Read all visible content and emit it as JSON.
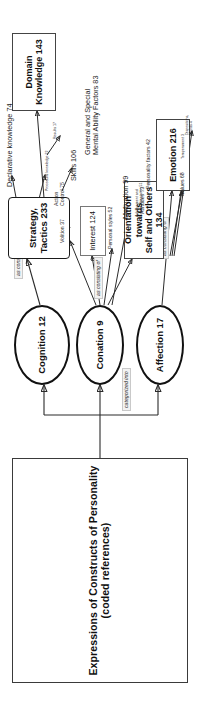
{
  "figure": {
    "title": "Expressions of Constructs of Personality (coded references)",
    "orientation": "rotated-90-ccw"
  },
  "relations": {
    "categorized_into": "categorized into",
    "as_consisting_of": "as consisting of"
  },
  "nodes": {
    "cognition": "Cognition 12",
    "conation": "Conation 9",
    "affection": "Affection 17",
    "strategy_tactics": "Strategy, Tactics 233",
    "domain_knowledge": "Domain Knowledge 143",
    "interest": "Interest 124",
    "orientation": "Orientation towards\nSelf and Others 134",
    "emotion": "Emotion 216"
  },
  "leaves": {
    "declarative_knowledge": "Declarative knowledge 74",
    "procedural_knowledge": "Procedural knowledge 22",
    "results": "Results 17",
    "skills": "Skills 106",
    "mental_ability": "General and Special\nMental Ability Factors 83",
    "volition": "Volition 37",
    "action_control": "Action\nControl 75",
    "personal_styles": "Personal styles 52",
    "motivation": "Motivation 99",
    "achievement": "Achievement and\nCareer Orientation 51",
    "attitudes": "Attitudes 73",
    "personality_factors": "Personality factors 42",
    "values": "Values 68",
    "temperament": "Temperament 3",
    "dispositions_moods": "Dispositions,\nMoods 4"
  }
}
